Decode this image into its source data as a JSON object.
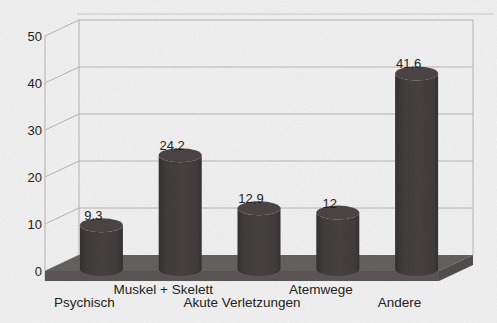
{
  "figure": {
    "kind": "scanned-statistical-figure",
    "style": "3d-cylinder-bar-chart"
  },
  "chart_data": {
    "type": "bar",
    "bar_shape": "cylinder-3d",
    "title": "",
    "xlabel": "",
    "ylabel": "",
    "categories": [
      "Psychisch",
      "Muskel + Skelett",
      "Akute Verletzungen",
      "Atemwege",
      "Andere"
    ],
    "values": [
      9.3,
      24.2,
      12.9,
      12,
      41.6
    ],
    "value_labels": [
      "9,3",
      "24,2",
      "12,9",
      "12",
      "41,6"
    ],
    "ylim": [
      0,
      50
    ],
    "yticks": [
      0,
      10,
      20,
      30,
      40,
      50
    ],
    "ytick_labels": [
      "0",
      "10",
      "20",
      "30",
      "40",
      "50"
    ],
    "grid": true,
    "legend": null,
    "label_rows": [
      2,
      1,
      2,
      1,
      2
    ],
    "colors": {
      "bar": "#454140",
      "bar_shade": "#393534",
      "bar_top": "#4f4a49",
      "floor_top": "#6a6766",
      "floor_front": "#5e5b5a",
      "floor_side": "#565352",
      "gridline": "#c1c0be",
      "faint_border": "#d9d8d6",
      "text": "#262524",
      "background": "#ffffff"
    }
  }
}
